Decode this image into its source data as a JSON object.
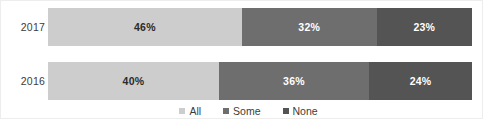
{
  "chart_data": {
    "type": "bar",
    "subtype": "stacked-horizontal-100pct",
    "title": "",
    "subtitle": "",
    "xlabel": "",
    "ylabel": "",
    "categories": [
      "2017",
      "2016"
    ],
    "series": [
      {
        "name": "All",
        "color": "#cdcdcd",
        "values": [
          46,
          32
        ]
      },
      {
        "name": "Some",
        "color": "#6e6e6e",
        "values": [
          32,
          36
        ]
      },
      {
        "name": "None",
        "color": "#545454",
        "values": [
          23,
          24
        ]
      }
    ],
    "rows": [
      {
        "category": "2017",
        "segments": [
          {
            "series": "All",
            "value": 46,
            "label": "46%",
            "width_pct": 45.7,
            "color": "#cdcdcd",
            "text_color": "#2b2b2b"
          },
          {
            "series": "Some",
            "value": 32,
            "label": "32%",
            "width_pct": 31.8,
            "color": "#6e6e6e",
            "text_color": "#ffffff"
          },
          {
            "series": "None",
            "value": 23,
            "label": "23%",
            "width_pct": 22.5,
            "color": "#545454",
            "text_color": "#ffffff"
          }
        ]
      },
      {
        "category": "2016",
        "segments": [
          {
            "series": "All",
            "value": 40,
            "label": "40%",
            "width_pct": 40.3,
            "color": "#cdcdcd",
            "text_color": "#2b2b2b"
          },
          {
            "series": "Some",
            "value": 36,
            "label": "36%",
            "width_pct": 35.4,
            "color": "#6e6e6e",
            "text_color": "#ffffff"
          },
          {
            "series": "None",
            "value": 24,
            "label": "24%",
            "width_pct": 24.3,
            "color": "#545454",
            "text_color": "#ffffff"
          }
        ]
      }
    ],
    "legend": {
      "position": "bottom-center",
      "entries": [
        {
          "label": "All",
          "color": "#cdcdcd"
        },
        {
          "label": "Some",
          "color": "#6e6e6e"
        },
        {
          "label": "None",
          "color": "#545454"
        }
      ]
    },
    "grid": false,
    "xlim": [
      0,
      100
    ],
    "axis_visible": false
  }
}
